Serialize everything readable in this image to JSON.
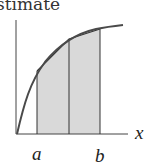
{
  "title": "stimate",
  "diagram": {
    "axis_label_x": "x",
    "label_a": "a",
    "label_b": "b",
    "colors": {
      "curve": "#555555",
      "shade": "#d6d6d6",
      "axis": "#333333"
    },
    "partitions": 2,
    "type": "trapezoid-rule illustration"
  }
}
